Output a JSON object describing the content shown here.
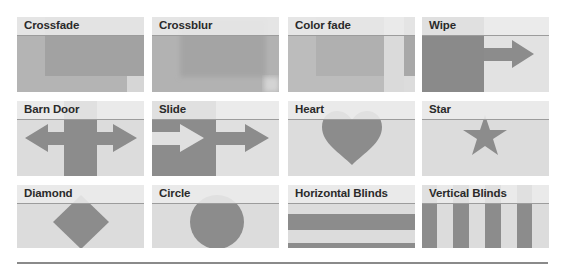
{
  "tiles": [
    {
      "label": "Crossfade",
      "effect": "crossfade"
    },
    {
      "label": "Crossblur",
      "effect": "crossblur"
    },
    {
      "label": "Color fade",
      "effect": "color-fade"
    },
    {
      "label": "Wipe",
      "effect": "wipe"
    },
    {
      "label": "Barn Door",
      "effect": "barn-door"
    },
    {
      "label": "Slide",
      "effect": "slide"
    },
    {
      "label": "Heart",
      "effect": "heart"
    },
    {
      "label": "Star",
      "effect": "star"
    },
    {
      "label": "Diamond",
      "effect": "diamond"
    },
    {
      "label": "Circle",
      "effect": "circle"
    },
    {
      "label": "Horizontal Blinds",
      "effect": "horizontal-blinds"
    },
    {
      "label": "Vertical Blinds",
      "effect": "vertical-blinds"
    }
  ],
  "colors": {
    "background": "#ffffff",
    "tile_body": "#dcdcdc",
    "header": "#ececec",
    "header_line": "#9c9c9c",
    "shape": "#8c8c8c",
    "label": "#2a2a2a"
  }
}
